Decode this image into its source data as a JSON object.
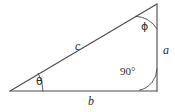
{
  "figure": {
    "type": "right-triangle-geometry-diagram",
    "background_color": "#ffffff",
    "stroke_color": "#4a4a4a",
    "text_color": "#2b2b2b"
  },
  "geometry": {
    "vertices": {
      "left": {
        "x": 10,
        "y": 91
      },
      "bottom_right": {
        "x": 157,
        "y": 91
      },
      "apex": {
        "x": 157,
        "y": 4
      }
    }
  },
  "sides": {
    "hypotenuse_label": "c",
    "base_label": "b",
    "vertical_label": "a"
  },
  "angles": {
    "left_label": "θ",
    "apex_label": "ϕ",
    "right_angle_label": "90°"
  }
}
